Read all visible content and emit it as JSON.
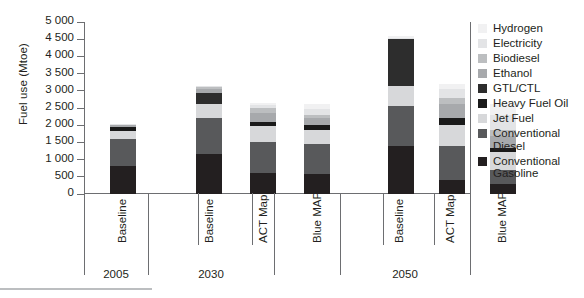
{
  "chart_data": {
    "type": "bar",
    "subtype": "stacked-bar",
    "title": "",
    "xlabel": "",
    "ylabel": "Fuel use (Mtoe)",
    "ylim": [
      0,
      5000
    ],
    "ytick_step": 500,
    "ytick_labels": [
      "5 000",
      "4 500",
      "4 000",
      "3 500",
      "3 000",
      "2 500",
      "2 000",
      "1 500",
      "1 000",
      "500",
      "0"
    ],
    "ytick_values": [
      5000,
      4500,
      4000,
      3500,
      3000,
      2500,
      2000,
      1500,
      1000,
      500,
      0
    ],
    "grid": false,
    "legend_position": "right",
    "groups": [
      {
        "label": "2005",
        "categories": [
          "Baseline"
        ]
      },
      {
        "label": "2030",
        "categories": [
          "Baseline",
          "ACT Map",
          "Blue MAP"
        ]
      },
      {
        "label": "2050",
        "categories": [
          "Baseline",
          "ACT Map",
          "Blue MAP"
        ]
      }
    ],
    "categories": [
      "2005 Baseline",
      "2030 Baseline",
      "2030 ACT Map",
      "2030 Blue MAP",
      "2050 Baseline",
      "2050 ACT Map",
      "2050 Blue MAP"
    ],
    "series": [
      {
        "name": "Conventional Gasoline",
        "color": "#231f20",
        "values": [
          800,
          1150,
          600,
          570,
          1400,
          400,
          300
        ]
      },
      {
        "name": "Conventional Diesel",
        "color": "#58595b",
        "values": [
          800,
          1050,
          900,
          880,
          1150,
          1000,
          400
        ]
      },
      {
        "name": "Jet Fuel",
        "color": "#d7d8da",
        "values": [
          230,
          420,
          470,
          420,
          600,
          620,
          520
        ]
      },
      {
        "name": "Heavy Fuel Oil",
        "color": "#1a1a1a",
        "values": [
          120,
          0,
          130,
          130,
          0,
          180,
          130
        ]
      },
      {
        "name": "GTL/CTL",
        "color": "#2d2d2d",
        "values": [
          0,
          330,
          0,
          0,
          1350,
          0,
          0
        ]
      },
      {
        "name": "Ethanol",
        "color": "#a7a9ac",
        "values": [
          50,
          90,
          260,
          200,
          0,
          420,
          330
        ]
      },
      {
        "name": "Biodiesel",
        "color": "#bcbec0",
        "values": [
          0,
          60,
          130,
          110,
          0,
          180,
          190
        ]
      },
      {
        "name": "Electricity",
        "color": "#e3e4e6",
        "values": [
          50,
          50,
          110,
          170,
          50,
          250,
          420
        ]
      },
      {
        "name": "Hydrogen",
        "color": "#f1f1f2",
        "values": [
          0,
          0,
          50,
          130,
          50,
          150,
          330
        ]
      }
    ],
    "totals": [
      2050,
      3150,
      2650,
      2610,
      4600,
      3200,
      2620
    ],
    "annotations": []
  },
  "legend": {
    "items": [
      {
        "label": "Hydrogen",
        "color": "#f1f1f2"
      },
      {
        "label": "Electricity",
        "color": "#e3e4e6"
      },
      {
        "label": "Biodiesel",
        "color": "#bcbec0"
      },
      {
        "label": "Ethanol",
        "color": "#a7a9ac"
      },
      {
        "label": "GTL/CTL",
        "color": "#2d2d2d"
      },
      {
        "label": "Heavy Fuel Oil",
        "color": "#1a1a1a"
      },
      {
        "label": "Jet Fuel",
        "color": "#d7d8da"
      },
      {
        "label": "Conventional\nDiesel",
        "color": "#58595b"
      },
      {
        "label": "Conventional\nGasoline",
        "color": "#231f20"
      }
    ]
  },
  "axis": {
    "y_title": "Fuel use (Mtoe)"
  },
  "colors": {
    "axis": "#6d6e71",
    "text": "#231f20",
    "rule": "#bcbec0",
    "background": "#ffffff"
  }
}
